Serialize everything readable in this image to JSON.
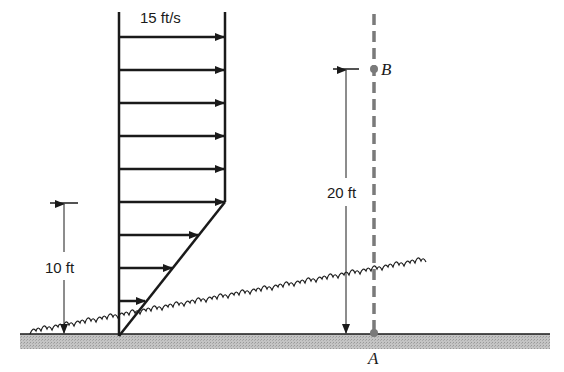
{
  "velocity_profile": {
    "label": "15 ft/s",
    "uniform_region_arrows": 6,
    "linear_region_arrows": 3
  },
  "dimensions": {
    "left_height_label": "10 ft",
    "right_height_label": "20 ft"
  },
  "points": {
    "top": "B",
    "bottom": "A"
  },
  "colors": {
    "line": "#1a1a1a",
    "dashed_line": "#7a7a7a",
    "ground": "#b5b5b5"
  }
}
